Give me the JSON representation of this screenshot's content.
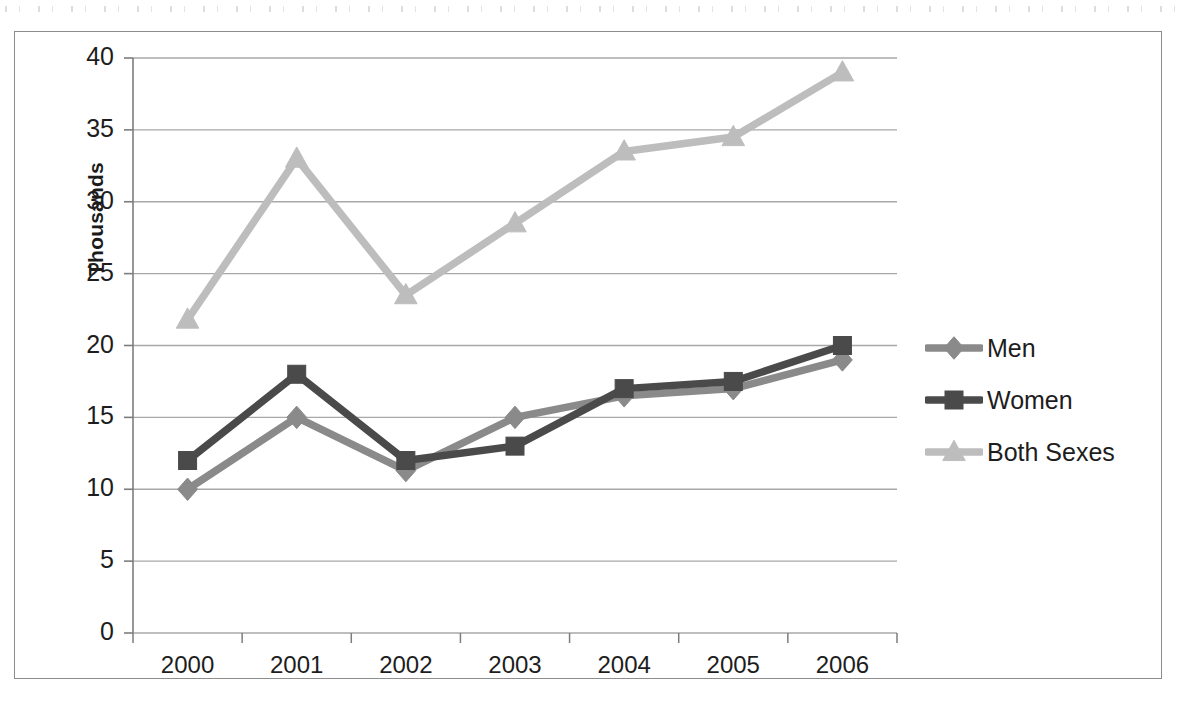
{
  "chart_data": {
    "type": "line",
    "title": "",
    "subtitle": "",
    "xlabel": "",
    "ylabel": "Thousands",
    "categories": [
      "2000",
      "2001",
      "2002",
      "2003",
      "2004",
      "2005",
      "2006"
    ],
    "x": [
      2000,
      2001,
      2002,
      2003,
      2004,
      2005,
      2006
    ],
    "ylim": [
      0,
      40
    ],
    "yticks": [
      0,
      5,
      10,
      15,
      20,
      25,
      30,
      35,
      40
    ],
    "ytick_labels": [
      "0",
      "5",
      "10",
      "15",
      "20",
      "25",
      "30",
      "35",
      "40"
    ],
    "grid": "horizontal",
    "legend_position": "right",
    "series": [
      {
        "name": "Men",
        "marker": "diamond",
        "color": "#8a8a8a",
        "values": [
          10.0,
          15.0,
          11.3,
          15.0,
          16.5,
          17.0,
          19.0
        ]
      },
      {
        "name": "Women",
        "marker": "square",
        "color": "#4a4a4a",
        "values": [
          12.0,
          18.0,
          12.0,
          13.0,
          17.0,
          17.5,
          20.0
        ]
      },
      {
        "name": "Both Sexes",
        "marker": "triangle",
        "color": "#bdbdbd",
        "values": [
          21.8,
          33.0,
          23.5,
          28.5,
          33.5,
          34.5,
          39.0
        ]
      }
    ]
  },
  "axis": {
    "y_title": "Thousands"
  },
  "legend": {
    "items": [
      {
        "label": "Men"
      },
      {
        "label": "Women"
      },
      {
        "label": "Both Sexes"
      }
    ]
  },
  "colors": {
    "men": "#8a8a8a",
    "women": "#4a4a4a",
    "both_sexes": "#bdbdbd",
    "gridline": "#a8a8a8",
    "axis": "#7d7d7d",
    "frame": "#8d8d8d",
    "text": "#1d1d1d"
  }
}
